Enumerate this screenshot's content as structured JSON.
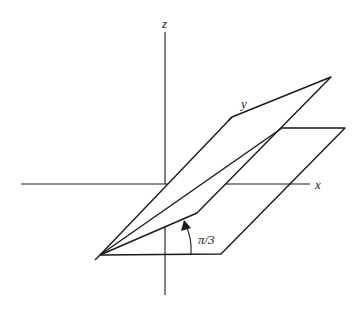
{
  "figure": {
    "axes": {
      "x_label": "x",
      "y_label": "y",
      "z_label": "z"
    },
    "angle_label": "π/3",
    "angle_value_radians": "pi/3",
    "planes": [
      {
        "name": "horizontal-plane",
        "role": "xy-plane"
      },
      {
        "name": "tilted-plane",
        "role": "plane at angle pi/3 to xy-plane"
      }
    ],
    "colors": {
      "plane_fill": "#dcdcdc",
      "line": "#1a1a1a",
      "background": "#ffffff"
    }
  }
}
